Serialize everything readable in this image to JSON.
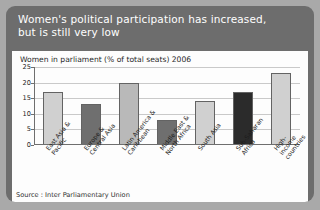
{
  "header": {
    "title_line1": "Women's political participation has increased,",
    "title_line2": "but is still very low"
  },
  "source": {
    "text": "Source : Inter Parliamentary Union"
  },
  "colors": {
    "card_background": "#6d6d6d",
    "panel_background": "#fdfdfd",
    "title_text": "#ffffff",
    "bar_light": "#d0d0d0",
    "bar_medium": "#6f6f6f",
    "bar_dark": "#2b2b2b",
    "grid": "#c9c9c9",
    "axis": "#6f6f6f"
  },
  "chart_data": {
    "type": "bar",
    "title": "Women in parliament (% of total seats) 2006",
    "xlabel": "",
    "ylabel": "",
    "ylim": [
      0,
      25
    ],
    "yticks": [
      0,
      5,
      10,
      15,
      20,
      25
    ],
    "grid": true,
    "legend": "none",
    "categories": [
      "East Asia &\nPacific",
      "Europe &\nCentral Asia",
      "Latin America &\nCaribbean",
      "Middle East &\nNorth Africa",
      "South Asia",
      "Sub-Saharan\nAfrica",
      "High-income\ncountries"
    ],
    "values": [
      17,
      13,
      20,
      8,
      14,
      17,
      23
    ],
    "bar_colors": [
      "#d0d0d0",
      "#6f6f6f",
      "#b9b9b9",
      "#6f6f6f",
      "#d0d0d0",
      "#2b2b2b",
      "#d0d0d0"
    ]
  }
}
